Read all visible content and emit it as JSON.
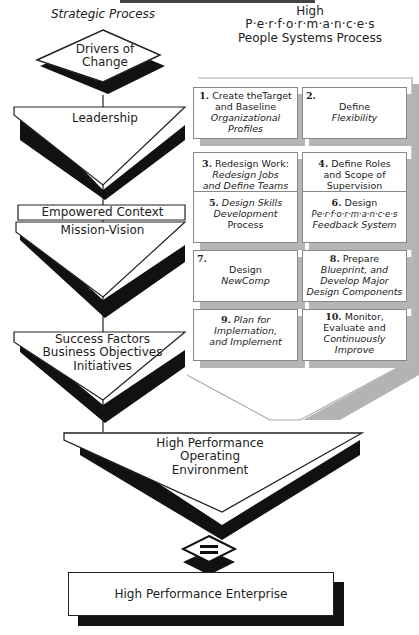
{
  "title_clipped": "High Performance Enterprise",
  "left_column": {
    "header": "Strategic Process",
    "stages": [
      {
        "label": "Drivers of Change",
        "lines": [
          "Drivers of",
          "Change"
        ]
      },
      {
        "label": "Leadership"
      },
      {
        "label": "Empowered Context"
      },
      {
        "label": "Mission-Vision"
      },
      {
        "label": "Success Factors Business Objectives Initiatives",
        "lines": [
          "Success Factors",
          "Business Objectives",
          "Initiatives"
        ]
      }
    ]
  },
  "right_column": {
    "header_lines": [
      "High",
      "P·e·r·f·o·r·m·a·n·c·e·s",
      "People Systems Process"
    ],
    "steps": [
      {
        "num": "1.",
        "lines": [
          "Create theTarget",
          "and Baseline",
          "Organizational",
          "Profiles"
        ]
      },
      {
        "num": "2.",
        "lines": [
          "Define",
          "Flexibility"
        ]
      },
      {
        "num": "3.",
        "lines": [
          "Redesign Work:",
          "Redesign Jobs",
          "and Define Teams"
        ]
      },
      {
        "num": "4.",
        "lines": [
          "Define Roles",
          "and Scope of",
          "Supervision"
        ]
      },
      {
        "num": "5.",
        "lines": [
          "Design Skills",
          "Development",
          "Process"
        ]
      },
      {
        "num": "6.",
        "lines": [
          "Design",
          "Pe·r·f·o·r·m·a·n·c·e·s",
          "Feedback System"
        ]
      },
      {
        "num": "7.",
        "lines": [
          "Design",
          "NewComp"
        ]
      },
      {
        "num": "8.",
        "lines": [
          "Prepare",
          "Blueprint, and",
          "Develop Major",
          "Design Components"
        ]
      },
      {
        "num": "9.",
        "lines": [
          "Plan for",
          "Implemation,",
          "and Implement"
        ]
      },
      {
        "num": "10.",
        "lines": [
          "Monitor,",
          "Evaluate and",
          "Continuously",
          "Improve"
        ]
      }
    ]
  },
  "convergence": {
    "lines": [
      "High Performance",
      "Operating",
      "Environment"
    ]
  },
  "equals_symbol": "=",
  "result": "High Performance Enterprise",
  "colors": {
    "black": "#111111",
    "shadow_gray": "#b5b5b5",
    "panel_border": "#999999"
  }
}
